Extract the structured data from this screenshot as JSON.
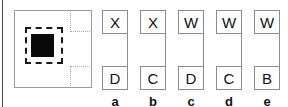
{
  "figure": {
    "type": "schematic-diagram",
    "width": 288,
    "height": 107,
    "background_color": "#ffffff"
  },
  "schematic": {
    "description": "outer square region with two dotted corner sub-regions, a dashed square and a solid black core square",
    "outer_border_color": "#9a9a9a",
    "dotted_border_color": "#adadad",
    "dashed_border_color": "#1a1a1a",
    "core_fill_color": "#0a0a0a"
  },
  "columns": [
    {
      "label": "a",
      "top_cell": "X",
      "bottom_cell": "D"
    },
    {
      "label": "b",
      "top_cell": "X",
      "bottom_cell": "C"
    },
    {
      "label": "c",
      "top_cell": "W",
      "bottom_cell": "D"
    },
    {
      "label": "d",
      "top_cell": "W",
      "bottom_cell": "C"
    },
    {
      "label": "e",
      "top_cell": "W",
      "bottom_cell": "B"
    }
  ],
  "style": {
    "cell_border_color": "#8c8c8c",
    "text_color": "#111111",
    "frame_edge_color": "#4a4a4a"
  }
}
